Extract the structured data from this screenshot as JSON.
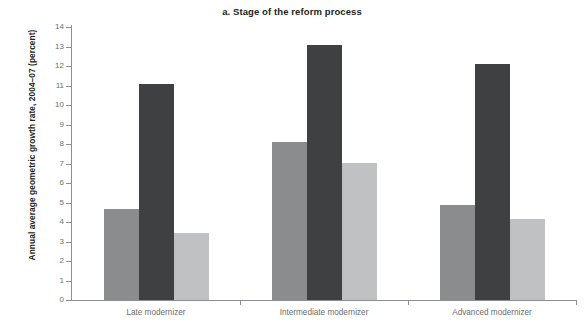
{
  "chart_data": {
    "type": "bar",
    "title": "a. Stage of the reform process",
    "xlabel": "",
    "ylabel": "Annual average geometric growth rate, 2004–07 (percent)",
    "ylim": [
      0,
      14
    ],
    "ytick_labels": [
      "0",
      "1",
      "2",
      "3",
      "4",
      "5",
      "6",
      "7",
      "8",
      "9",
      "10",
      "11",
      "12",
      "13",
      "14"
    ],
    "ytick_values": [
      0,
      1,
      2,
      3,
      4,
      5,
      6,
      7,
      8,
      9,
      10,
      11,
      12,
      13,
      14
    ],
    "grid": false,
    "legend": "none",
    "categories": [
      "Late modernizer",
      "Intermediate modernizer",
      "Advanced modernizer"
    ],
    "series": [
      {
        "name": "series-1",
        "color": "#8a8c8e",
        "values": [
          4.65,
          8.1,
          4.85
        ]
      },
      {
        "name": "series-2",
        "color": "#3f4042",
        "values": [
          11.1,
          13.1,
          12.1
        ]
      },
      {
        "name": "series-3",
        "color": "#c0c1c3",
        "values": [
          3.45,
          7.05,
          4.15
        ]
      }
    ]
  },
  "colors": {
    "axis": "#8d8f92",
    "tick_text": "#6d6e71",
    "title_text": "#231f20",
    "background": "#ffffff"
  }
}
